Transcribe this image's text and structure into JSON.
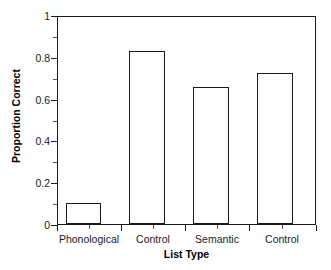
{
  "chart_data": {
    "type": "bar",
    "title": "",
    "subtitle": "",
    "xlabel": "List Type",
    "ylabel": "Proportion Correct",
    "categories": [
      "Phonological",
      "Control",
      "Semantic",
      "Control"
    ],
    "values": [
      0.1,
      0.835,
      0.66,
      0.73
    ],
    "series": [
      {
        "name": "Proportion Correct",
        "values": [
          0.1,
          0.835,
          0.66,
          0.73
        ]
      }
    ],
    "ylim": [
      0,
      1
    ],
    "yticks": [
      "0",
      "0.2",
      "0.4",
      "0.6",
      "0.8",
      "1"
    ],
    "ytick_values": [
      0,
      0.2,
      0.4,
      0.6,
      0.8,
      1
    ],
    "yminor_tick_values": [
      0.1,
      0.3,
      0.5,
      0.7,
      0.9
    ],
    "grid": false,
    "legend": "none",
    "bar_fill_color": "#ffffff",
    "bar_edge_color": "#1a1a1a",
    "axis_color": "#1a1a1a",
    "background_color": "#ffffff"
  },
  "figure": {
    "bars": [
      {
        "label": "Phonological",
        "value": 0.1,
        "value_text": "0.10"
      },
      {
        "label": "Control",
        "value": 0.835,
        "value_text": "0.835"
      },
      {
        "label": "Semantic",
        "value": 0.66,
        "value_text": "0.66"
      },
      {
        "label": "Control",
        "value": 0.73,
        "value_text": "0.73"
      }
    ]
  }
}
